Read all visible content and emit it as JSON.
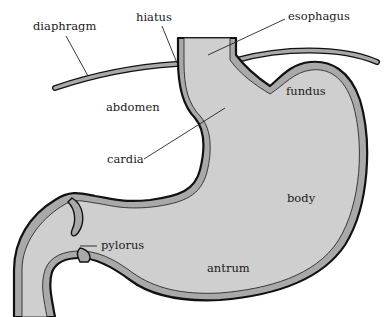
{
  "diagram": {
    "colors": {
      "wall": "#a9a9a9",
      "lumen": "#cfcfcf",
      "outline": "#111111",
      "label": "#1a1a1a",
      "background": "#ffffff"
    },
    "labels": {
      "diaphragm": "diaphragm",
      "hiatus": "hiatus",
      "esophagus": "esophagus",
      "abdomen": "abdomen",
      "fundus": "fundus",
      "cardia": "cardia",
      "body": "body",
      "pylorus": "pylorus",
      "antrum": "antrum"
    }
  }
}
